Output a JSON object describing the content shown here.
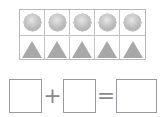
{
  "figure": {
    "grid": {
      "columns": 5,
      "rows": [
        {
          "shape": "circle",
          "count": 5,
          "color": "#bdbdbd"
        },
        {
          "shape": "triangle",
          "count": 5,
          "color": "#a8a8a8"
        }
      ]
    },
    "equation": {
      "boxes": [
        "",
        "",
        ""
      ],
      "operators": [
        "+",
        "="
      ]
    }
  }
}
